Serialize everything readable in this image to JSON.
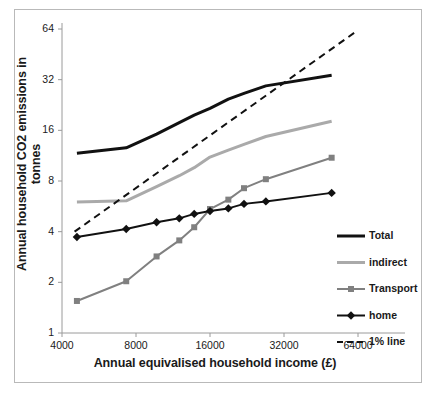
{
  "chart_data": {
    "type": "line",
    "title": "",
    "xlabel": "Annual equivalised household income (£)",
    "ylabel": "Annual household CO2 emissions in tonnes",
    "xscale": "log",
    "yscale": "log",
    "xlim": [
      4000,
      64000
    ],
    "ylim": [
      1,
      64
    ],
    "xticks": [
      "4000",
      "8000",
      "16000",
      "32000",
      "64000"
    ],
    "xtick_values": [
      4000,
      8000,
      16000,
      32000,
      64000
    ],
    "yticks": [
      "1",
      "2",
      "4",
      "8",
      "16",
      "32",
      "64"
    ],
    "ytick_values": [
      1,
      2,
      4,
      8,
      16,
      32,
      64
    ],
    "grid": false,
    "legend_position": "right",
    "x": [
      4600,
      7300,
      9700,
      12000,
      13800,
      16000,
      19000,
      22000,
      27000,
      50000
    ],
    "series": [
      {
        "name": "Total",
        "label": "Total",
        "color": "#111111",
        "marker": "none",
        "linestyle": "solid",
        "width": 3,
        "values": [
          11.7,
          12.6,
          15.2,
          17.8,
          19.7,
          21.6,
          24.5,
          26.5,
          29.4,
          34.0
        ]
      },
      {
        "name": "indirect",
        "label": "indirect",
        "color": "#aaaaaa",
        "marker": "none",
        "linestyle": "solid",
        "width": 3,
        "values": [
          6.0,
          6.1,
          7.4,
          8.6,
          9.6,
          11.1,
          12.2,
          13.2,
          14.7,
          18.1
        ]
      },
      {
        "name": "Transport",
        "label": "Transport",
        "color": "#808080",
        "marker": "square",
        "linestyle": "solid",
        "width": 2,
        "values": [
          1.55,
          2.03,
          2.85,
          3.55,
          4.25,
          5.45,
          6.2,
          7.25,
          8.2,
          11.0
        ]
      },
      {
        "name": "home",
        "label": "home",
        "color": "#111111",
        "marker": "diamond",
        "linestyle": "solid",
        "width": 2,
        "values": [
          3.72,
          4.15,
          4.55,
          4.8,
          5.1,
          5.3,
          5.5,
          5.85,
          6.05,
          6.8
        ]
      },
      {
        "name": "1% line",
        "label": "1% line",
        "color": "#111111",
        "marker": "none",
        "linestyle": "dashed",
        "width": 2,
        "x": [
          4500,
          64000
        ],
        "values": [
          4.0,
          63.0
        ]
      }
    ]
  },
  "legend": {
    "items": [
      {
        "label": "Total",
        "color": "#111111",
        "style": "solid",
        "marker": "none",
        "width": 3
      },
      {
        "label": "indirect",
        "color": "#aaaaaa",
        "style": "solid",
        "marker": "none",
        "width": 3
      },
      {
        "label": "Transport",
        "color": "#808080",
        "style": "solid",
        "marker": "square",
        "width": 2
      },
      {
        "label": "home",
        "color": "#111111",
        "style": "solid",
        "marker": "diamond",
        "width": 2
      },
      {
        "label": "1% line",
        "color": "#111111",
        "style": "dashed",
        "marker": "none",
        "width": 2
      }
    ]
  },
  "axes": {
    "x_axis_label": "Annual equivalised household income (£)",
    "y_axis_label": "Annual household CO2 emissions in tonnes"
  }
}
